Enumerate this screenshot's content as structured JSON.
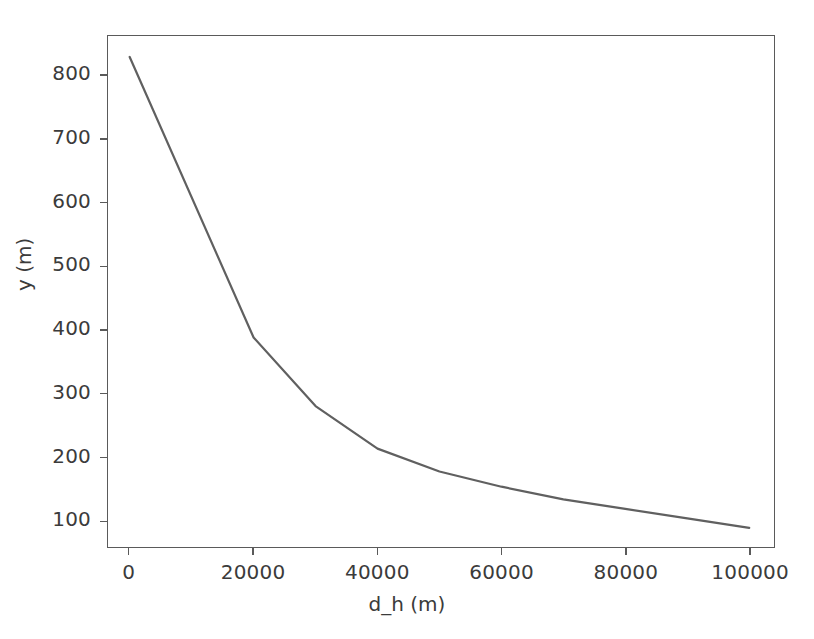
{
  "chart_data": {
    "type": "line",
    "title": "",
    "xlabel": "d_h (m)",
    "ylabel": "y (m)",
    "xlim": [
      -3500,
      104000
    ],
    "ylim": [
      58,
      863
    ],
    "grid": false,
    "legend": null,
    "line_color": "#606060",
    "line_width": 2.2,
    "xticks": [
      0,
      20000,
      40000,
      60000,
      80000,
      100000
    ],
    "xtick_labels": [
      "0",
      "20000",
      "40000",
      "60000",
      "80000",
      "100000"
    ],
    "yticks": [
      100,
      200,
      300,
      400,
      500,
      600,
      700,
      800
    ],
    "ytick_labels": [
      "100",
      "200",
      "300",
      "400",
      "500",
      "600",
      "700",
      "800"
    ],
    "series": [
      {
        "name": "y",
        "x": [
          0,
          20000,
          30000,
          40000,
          50000,
          60000,
          70000,
          80000,
          90000,
          100000
        ],
        "values": [
          830,
          388,
          280,
          213,
          177,
          153,
          133,
          118,
          103,
          88
        ]
      }
    ]
  }
}
